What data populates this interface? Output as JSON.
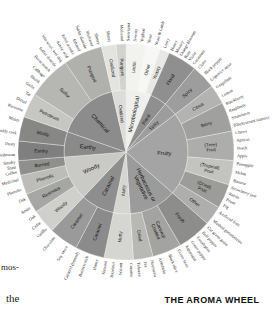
{
  "figure": {
    "title": "THE AROMA WHEEL",
    "caption_fragments": [
      "mos-",
      "the"
    ]
  },
  "chart_data": {
    "type": "pie",
    "title": "THE AROMA WHEEL",
    "subtype": "sunburst / radial hierarchy (wine aroma wheel)",
    "rings": [
      "inner category",
      "middle subcategory",
      "outer descriptor"
    ],
    "legend_position": "none",
    "grid": false,
    "start_angle_deg": -90,
    "colors": {
      "pungent": "#9a9a9a",
      "chemical": "#8c8c8c",
      "oxidized": "#dcdcda",
      "microbiological": "#efefec",
      "floral": "#8f8f8f",
      "spicy": "#9d9d9d",
      "fruity": "#a4a4a4",
      "herbaceous": "#9b9b9b",
      "nutty": "#d5d5d2",
      "caramel": "#8e8e8e",
      "woody": "#c9c9c6",
      "earthy": "#8a8a8a",
      "text": "#1a1a1a",
      "background": "#ffffff"
    },
    "categories": [
      {
        "name": "Microbiological",
        "color": "#efefec",
        "weight": 9,
        "subcategories": [
          {
            "name": "Lactic",
            "color": "#f2f2ef",
            "weight": 4,
            "descriptors": [
              "Sauerkraut",
              "Sweaty",
              "Yoghurt"
            ]
          },
          {
            "name": "Other",
            "color": "#f7f7f5",
            "weight": 3,
            "descriptors": [
              "Yeast",
              "Yeast & Lamb"
            ]
          },
          {
            "name": "Yeasty",
            "color": "#e8e8e5",
            "weight": 2,
            "descriptors": [
              "Leesy"
            ]
          }
        ]
      },
      {
        "name": "Floral",
        "color": "#8f8f8f",
        "weight": 6,
        "subcategories": [
          {
            "name": "Floral",
            "color": "#8f8f8f",
            "weight": 6,
            "descriptors": [
              "Honey",
              "Mousey",
              "Orange blossom",
              "Rose",
              "Violet",
              "Geranium"
            ]
          }
        ]
      },
      {
        "name": "Spicy",
        "color": "#9d9d9d",
        "weight": 5,
        "subcategories": [
          {
            "name": "Spicy",
            "color": "#9d9d9d",
            "weight": 5,
            "descriptors": [
              "Clove",
              "Black pepper",
              "Liquorice anise"
            ]
          }
        ]
      },
      {
        "name": "Fruity",
        "color": "#a4a4a4",
        "weight": 30,
        "subcategories": [
          {
            "name": "Citrus",
            "color": "#b3b3b1",
            "weight": 4,
            "descriptors": [
              "Grapefruit",
              "Lemon"
            ]
          },
          {
            "name": "Berry",
            "color": "#a0a09e",
            "weight": 6,
            "descriptors": [
              "Blackberry",
              "Raspberry",
              "Strawberry",
              "Blackcurrant (cassis)"
            ]
          },
          {
            "name": "(Tree) Fruit",
            "color": "#adadab",
            "weight": 6,
            "descriptors": [
              "Cherry",
              "Apricot",
              "Peach",
              "Apple"
            ]
          },
          {
            "name": "(Tropical) Fruit",
            "color": "#c3c3c0",
            "weight": 5,
            "descriptors": [
              "Pineapple",
              "Melon",
              "Banana"
            ]
          },
          {
            "name": "(Dried) Fruit",
            "color": "#9c9c9a",
            "weight": 5,
            "descriptors": [
              "Strawberry jam",
              "Raisin",
              "Prune",
              "Fig"
            ]
          },
          {
            "name": "Other",
            "color": "#aeaeac",
            "weight": 4,
            "descriptors": [
              "Artificial fruit",
              "Mashed gooseberries"
            ]
          }
        ]
      },
      {
        "name": "Herbaceous or Vegetative",
        "color": "#9b9b9b",
        "weight": 17,
        "subcategories": [
          {
            "name": "Fresh",
            "color": "#8d8d8b",
            "weight": 7,
            "descriptors": [
              "Cut green grass",
              "Bell pepper",
              "Eucalyptus",
              "Green pepper",
              "Asparagus"
            ]
          },
          {
            "name": "Canned/ Cooked",
            "color": "#a3a3a1",
            "weight": 6,
            "descriptors": [
              "Green bean",
              "Black olive",
              "Artichoke"
            ]
          },
          {
            "name": "Dried",
            "color": "#b8b8b5",
            "weight": 4,
            "descriptors": [
              "Hay/straw",
              "Tea",
              "Tobacco"
            ]
          }
        ]
      },
      {
        "name": "Nutty",
        "color": "#d5d5d2",
        "weight": 6,
        "subcategories": [
          {
            "name": "Nutty",
            "color": "#d5d5d2",
            "weight": 6,
            "descriptors": [
              "Coconut",
              "Walnut",
              "Hazelnut",
              "Almond"
            ]
          }
        ]
      },
      {
        "name": "Caramel",
        "color": "#8e8e8e",
        "weight": 12,
        "subcategories": [
          {
            "name": "Caramel",
            "color": "#8b8b8b",
            "weight": 6,
            "descriptors": [
              "Honey",
              "Butterscotch",
              "Caramel (burned)"
            ]
          },
          {
            "name": "Caramel",
            "color": "#9a9a9a",
            "weight": 6,
            "descriptors": [
              "Soy sauce",
              "Chocolate"
            ]
          }
        ]
      },
      {
        "name": "Woody",
        "color": "#c9c9c6",
        "weight": 16,
        "subcategories": [
          {
            "name": "Woody",
            "color": "#cfcfcc",
            "weight": 5,
            "descriptors": [
              "Vanilla",
              "Cedar",
              "Oak"
            ]
          },
          {
            "name": "Resinous",
            "color": "#a6a6a4",
            "weight": 4,
            "descriptors": [
              "Resin",
              "Oak"
            ]
          },
          {
            "name": "Phenolic",
            "color": "#bcbcb9",
            "weight": 4,
            "descriptors": [
              "Phenolic",
              "Medicinal"
            ]
          },
          {
            "name": "Burned",
            "color": "#8f8f8d",
            "weight": 3,
            "descriptors": [
              "Coffee",
              "Toast",
              "Smoky"
            ]
          }
        ]
      },
      {
        "name": "Earthy",
        "color": "#8a8a8a",
        "weight": 9,
        "subcategories": [
          {
            "name": "Earthy",
            "color": "#7f7f7f",
            "weight": 4,
            "descriptors": [
              "Mushroom",
              "Dusty"
            ]
          },
          {
            "name": "Moldy",
            "color": "#878785",
            "weight": 5,
            "descriptors": [
              "Mouldy cork",
              "Musty"
            ]
          }
        ]
      },
      {
        "name": "Chemical",
        "color": "#8c8c8c",
        "weight": 22,
        "subcategories": [
          {
            "name": "Petroleum",
            "color": "#c6c6c3",
            "weight": 5,
            "descriptors": [
              "Kerosene",
              "Diesel",
              "Tar"
            ]
          },
          {
            "name": "Sulfur",
            "color": "#b6b6b3",
            "weight": 9,
            "descriptors": [
              "Garlic",
              "Skunk",
              "Cabbage",
              "Burnt match",
              "Sulfur dioxide",
              "Wet wool, wet dog"
            ]
          },
          {
            "name": "Pungent",
            "color": "#b0b0ad",
            "weight": 8,
            "descriptors": [
              "Acetic acid",
              "Ethyl acetate",
              "Ethanol",
              "Sulfur dioxide",
              "Methanol",
              "Sherry"
            ]
          }
        ]
      },
      {
        "name": "Oxidized",
        "color": "#dcdcda",
        "weight": 5,
        "subcategories": [
          {
            "name": "Oxidized",
            "color": "#e3e3e0",
            "weight": 3,
            "descriptors": [
              "Sherry"
            ]
          },
          {
            "name": "Pungent",
            "color": "#d2d2cf",
            "weight": 2,
            "descriptors": [
              "Methanol"
            ]
          }
        ]
      }
    ]
  }
}
